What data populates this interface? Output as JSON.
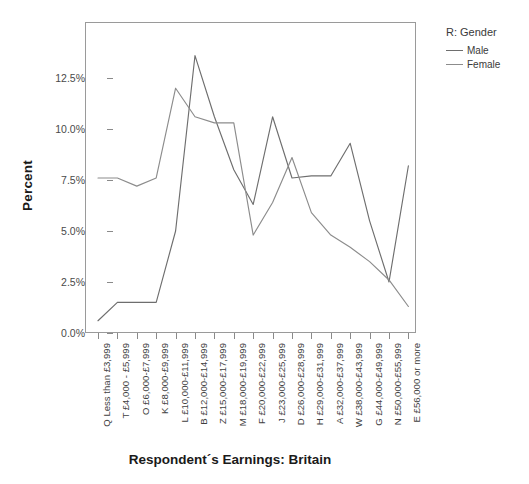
{
  "chart_data": {
    "type": "line",
    "title": "",
    "xlabel": "Respondent´s Earnings: Britain",
    "ylabel": "Percent",
    "ylim": [
      0,
      13.75
    ],
    "yticks": [
      "0.0%",
      "2.5%",
      "5.0%",
      "7.5%",
      "10.0%",
      "12.5%"
    ],
    "ytick_values": [
      0,
      2.5,
      5,
      7.5,
      10,
      12.5
    ],
    "grid": false,
    "legend_position": "right",
    "legend_title": "R: Gender",
    "categories": [
      "Q Less than £3,999",
      "T £4,000 - £5,999",
      "O £6,000-£7,999",
      "K £8,000-£9,999",
      "L £10,000-£11,999",
      "B £12,000-£14,999",
      "Z £15,000-£17,999",
      "M £18,000-£19,999",
      "F £20,000-£22,999",
      "J £23,000-£25,999",
      "D £26,000-£28,999",
      "H £29,000-£31,999",
      "A £32,000-£37,999",
      "W £38,000-£43,999",
      "G £44,000-£49,999",
      "N £50,000-£55,999",
      "E £56,000 or more"
    ],
    "series": [
      {
        "name": "Male",
        "color": "#6e6e6e",
        "values": [
          0.6,
          1.5,
          1.5,
          1.5,
          5.0,
          13.6,
          10.6,
          8.0,
          6.3,
          10.6,
          7.6,
          7.7,
          7.7,
          9.3,
          5.5,
          2.5,
          8.2
        ]
      },
      {
        "name": "Female",
        "color": "#8c8c8c",
        "values": [
          7.6,
          7.6,
          7.2,
          7.6,
          12.0,
          10.6,
          10.3,
          10.3,
          4.8,
          6.4,
          8.6,
          5.9,
          4.8,
          4.2,
          3.5,
          2.6,
          1.3
        ]
      }
    ]
  }
}
